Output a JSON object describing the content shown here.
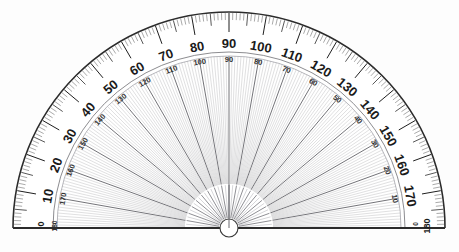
{
  "instrument": {
    "name": "semicircular-protractor",
    "type": "half-circle 180 degree protractor",
    "center_x": 229,
    "center_y": 228,
    "outer_radius": 216,
    "rim_inner_radius": 176,
    "fan_outer_radius": 172,
    "fan_inner_radius": 44,
    "hub_radius": 9
  },
  "colors": {
    "background": "#fdfdfd",
    "body_fill": "#ffffff",
    "rim_line": "#2b2b2b",
    "tick_major": "#1f1f1f",
    "tick_minor": "#555555",
    "ray_fine": "#b9b9bd",
    "ray_decade": "#5a5a60",
    "label_outer": "#1a1a1a",
    "label_inner": "#333333",
    "baseline": "#2b2b2b",
    "hub_stroke": "#3a3a3a"
  },
  "scales": {
    "outer": {
      "name": "outer-scale-clockwise",
      "direction": "left-to-right ascending",
      "start": 0,
      "end": 180,
      "step": 10,
      "labels": [
        "0",
        "10",
        "20",
        "30",
        "40",
        "50",
        "60",
        "70",
        "80",
        "90",
        "100",
        "110",
        "120",
        "130",
        "140",
        "150",
        "160",
        "170",
        "180"
      ]
    },
    "inner": {
      "name": "inner-scale-counterclockwise",
      "direction": "left-to-right descending",
      "start": 180,
      "end": 0,
      "step": 10,
      "labels": [
        "180",
        "170",
        "160",
        "150",
        "140",
        "130",
        "120",
        "110",
        "100",
        "90",
        "80",
        "70",
        "60",
        "50",
        "40",
        "30",
        "20",
        "10",
        "0"
      ]
    }
  },
  "graduations": {
    "minor_step_degrees": 1,
    "medium_step_degrees": 5,
    "major_step_degrees": 10,
    "minor_length": 7,
    "medium_length": 12,
    "major_length": 19
  },
  "ray_fan": {
    "fine_step_degrees": 1,
    "decade_step_degrees": 10,
    "count_fine": 179,
    "count_decade": 17
  },
  "baseline": {
    "name": "base-edge",
    "left_x": 13,
    "right_x": 445,
    "y": 228
  },
  "endpoint_labels": {
    "left": {
      "outer": "0",
      "inner": "180"
    },
    "right": {
      "outer": "180",
      "inner": "0"
    }
  }
}
